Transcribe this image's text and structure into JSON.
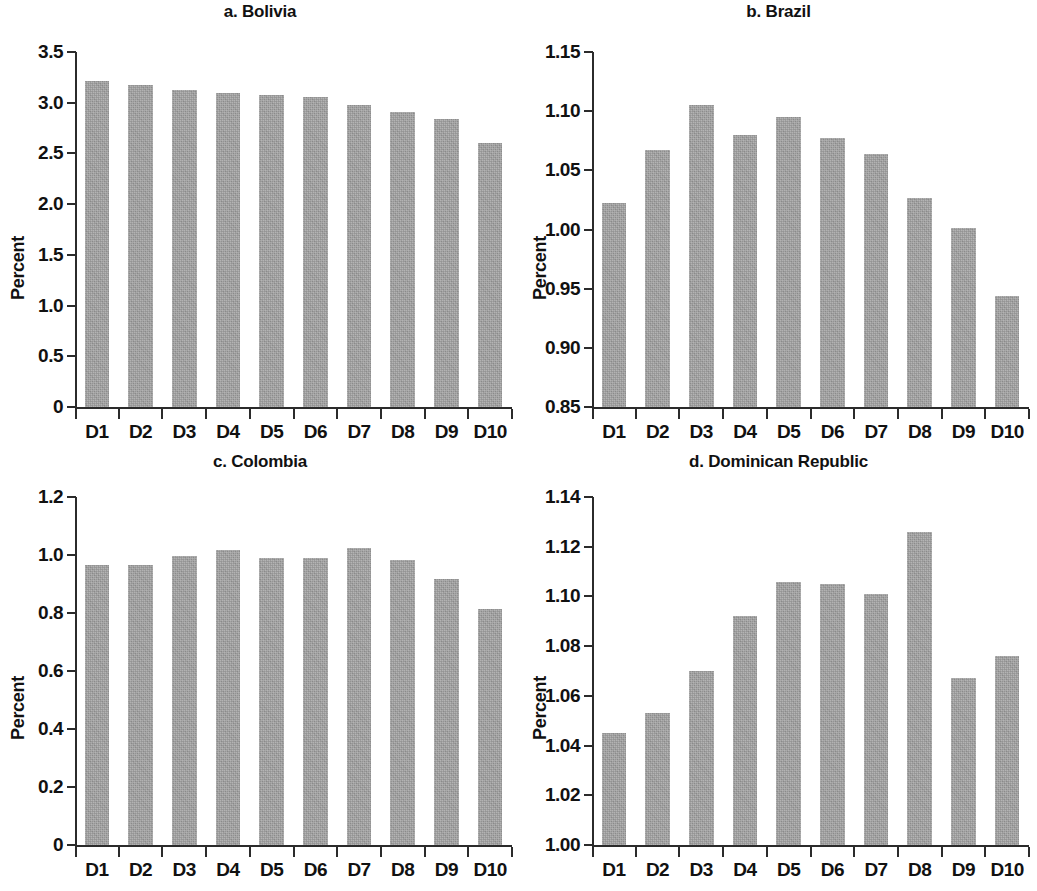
{
  "figure": {
    "ylabel": "Percent",
    "bar_color": "#9d9d9d",
    "axis_color": "#2b2b2b",
    "text_color": "#111111",
    "background": "#ffffff"
  },
  "chart_data": [
    {
      "type": "bar",
      "title": "a. Bolivia",
      "panel": "a",
      "xlabel": "",
      "ylabel": "Percent",
      "categories": [
        "D1",
        "D2",
        "D3",
        "D4",
        "D5",
        "D6",
        "D7",
        "D8",
        "D9",
        "D10"
      ],
      "values": [
        3.21,
        3.17,
        3.13,
        3.1,
        3.08,
        3.06,
        2.98,
        2.91,
        2.84,
        2.6
      ],
      "ylim": [
        0,
        3.5
      ],
      "yticks": [
        0,
        0.5,
        1.0,
        1.5,
        2.0,
        2.5,
        3.0,
        3.5
      ],
      "ytick_labels": [
        "0",
        "0.5",
        "1.0",
        "1.5",
        "2.0",
        "2.5",
        "3.0",
        "3.5"
      ],
      "grid": false,
      "legend": null
    },
    {
      "type": "bar",
      "title": "b. Brazil",
      "panel": "b",
      "xlabel": "",
      "ylabel": "Percent",
      "categories": [
        "D1",
        "D2",
        "D3",
        "D4",
        "D5",
        "D6",
        "D7",
        "D8",
        "D9",
        "D10"
      ],
      "values": [
        1.022,
        1.067,
        1.105,
        1.08,
        1.095,
        1.077,
        1.064,
        1.027,
        1.001,
        0.944
      ],
      "ylim": [
        0.85,
        1.15
      ],
      "yticks": [
        0.85,
        0.9,
        0.95,
        1.0,
        1.05,
        1.1,
        1.15
      ],
      "ytick_labels": [
        "0.85",
        "0.90",
        "0.95",
        "1.00",
        "1.05",
        "1.10",
        "1.15"
      ],
      "grid": false,
      "legend": null
    },
    {
      "type": "bar",
      "title": "c. Colombia",
      "panel": "c",
      "xlabel": "",
      "ylabel": "Percent",
      "categories": [
        "D1",
        "D2",
        "D3",
        "D4",
        "D5",
        "D6",
        "D7",
        "D8",
        "D9",
        "D10"
      ],
      "values": [
        0.967,
        0.965,
        0.995,
        1.018,
        0.989,
        0.988,
        1.024,
        0.983,
        0.918,
        0.813
      ],
      "ylim": [
        0,
        1.2
      ],
      "yticks": [
        0,
        0.2,
        0.4,
        0.6,
        0.8,
        1.0,
        1.2
      ],
      "ytick_labels": [
        "0",
        "0.2",
        "0.4",
        "0.6",
        "0.8",
        "1.0",
        "1.2"
      ],
      "grid": false,
      "legend": null
    },
    {
      "type": "bar",
      "title": "d. Dominican Republic",
      "panel": "d",
      "xlabel": "",
      "ylabel": "Percent",
      "categories": [
        "D1",
        "D2",
        "D3",
        "D4",
        "D5",
        "D6",
        "D7",
        "D8",
        "D9",
        "D10"
      ],
      "values": [
        1.045,
        1.053,
        1.07,
        1.092,
        1.106,
        1.105,
        1.101,
        1.126,
        1.067,
        1.076
      ],
      "ylim": [
        1.0,
        1.14
      ],
      "yticks": [
        1.0,
        1.02,
        1.04,
        1.06,
        1.08,
        1.1,
        1.12,
        1.14
      ],
      "ytick_labels": [
        "1.00",
        "1.02",
        "1.04",
        "1.06",
        "1.08",
        "1.10",
        "1.12",
        "1.14"
      ],
      "grid": false,
      "legend": null
    }
  ]
}
